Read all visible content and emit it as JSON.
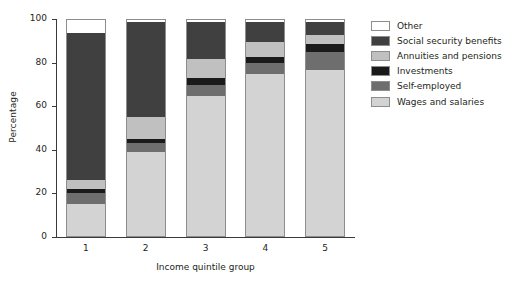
{
  "chart_data": {
    "type": "bar",
    "subtype": "stacked-bar-100",
    "title": "",
    "xlabel": "Income quintile group",
    "ylabel": "Percentage",
    "categories": [
      "1",
      "2",
      "3",
      "4",
      "5"
    ],
    "ylim": [
      0,
      100
    ],
    "yticks": [
      0,
      20,
      40,
      60,
      80,
      100
    ],
    "ytick_labels": [
      "0",
      "20",
      "40",
      "60",
      "80",
      "100"
    ],
    "grid": false,
    "legend_position": "right",
    "stack_order_bottom_to_top": [
      "Wages and salaries",
      "Self-employed",
      "Investments",
      "Annuities and pensions",
      "Social security benefits",
      "Other"
    ],
    "series": [
      {
        "name": "Wages and salaries",
        "color": "#d3d3d3",
        "values": [
          15,
          39,
          65,
          75,
          77
        ]
      },
      {
        "name": "Self-employed",
        "color": "#6e6e6e",
        "values": [
          5,
          4,
          5,
          5,
          8
        ]
      },
      {
        "name": "Investments",
        "color": "#1a1a1a",
        "values": [
          2,
          2,
          3,
          3,
          4
        ]
      },
      {
        "name": "Annuities and pensions",
        "color": "#c0c0c0",
        "values": [
          4,
          10,
          9,
          7,
          4
        ]
      },
      {
        "name": "Social security benefits",
        "color": "#404040",
        "values": [
          68,
          44,
          17,
          9,
          6
        ]
      },
      {
        "name": "Other",
        "color": "#ffffff",
        "values": [
          6,
          1,
          1,
          1,
          1
        ]
      }
    ]
  },
  "legend": {
    "items": [
      {
        "label": "Other",
        "color": "#ffffff"
      },
      {
        "label": "Social security benefits",
        "color": "#404040"
      },
      {
        "label": "Annuities and pensions",
        "color": "#c0c0c0"
      },
      {
        "label": "Investments",
        "color": "#1a1a1a"
      },
      {
        "label": "Self-employed",
        "color": "#6e6e6e"
      },
      {
        "label": "Wages and salaries",
        "color": "#d3d3d3"
      }
    ]
  }
}
